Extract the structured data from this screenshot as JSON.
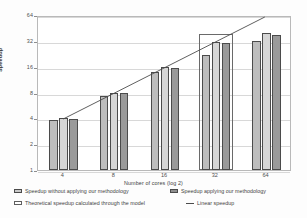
{
  "chart_data": {
    "type": "bar",
    "title": "",
    "xlabel": "Number of cores (log 2)",
    "ylabel": "Speedup",
    "categories": [
      "4",
      "8",
      "16",
      "32",
      "64"
    ],
    "yticks": [
      "1",
      "2",
      "4",
      "8",
      "16",
      "32",
      "64"
    ],
    "ylim": [
      1,
      64
    ],
    "yscale": "log2",
    "grid": true,
    "legend_position": "bottom",
    "series": [
      {
        "name": "Speedup without applying our methodology",
        "color": "#bdbdbd",
        "values": [
          3.8,
          7.3,
          14.0,
          22.0,
          32.0
        ]
      },
      {
        "name": "Speedup applying our methodology",
        "color": "#d6d6d6",
        "values": [
          4.0,
          8.0,
          16.0,
          31.0,
          40.0
        ]
      },
      {
        "name": "Speedup applying our methodology (dark)",
        "color": "#9a9a9a",
        "values": [
          3.9,
          7.8,
          15.6,
          30.0,
          37.0
        ]
      },
      {
        "name": "Theoretical speedup calculated through the model",
        "color": "#ffffff",
        "values": [
          null,
          null,
          null,
          38.0,
          null
        ]
      }
    ],
    "line_series": [
      {
        "name": "Linear speedup",
        "color": "#4b4b4b",
        "x": [
          "4",
          "64"
        ],
        "values": [
          4,
          64
        ]
      }
    ]
  },
  "legend": {
    "items": [
      {
        "label": "Speedup without applying our methodology",
        "marker": "swatch-light"
      },
      {
        "label": "Speedup applying our methodology",
        "marker": "swatch-dark"
      },
      {
        "label": "Theoretical speedup calculated through the model",
        "marker": "swatch-outline"
      },
      {
        "label": "Linear speedup",
        "marker": "line-dash"
      }
    ]
  }
}
